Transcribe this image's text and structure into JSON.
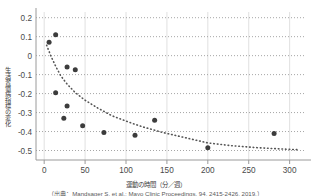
{
  "chart_data": {
    "type": "scatter",
    "title": "",
    "subtitle": "",
    "xlabel": "運動の時間（分／週）",
    "ylabel": "生活習慣病指標の変化",
    "xlim": [
      -10,
      320
    ],
    "ylim": [
      -0.55,
      0.23
    ],
    "xticks": [
      0,
      50,
      100,
      150,
      200,
      250,
      300
    ],
    "xticklabels": [
      "0",
      "50",
      "100",
      "150",
      "200",
      "250",
      "300"
    ],
    "yticks": [
      0.2,
      0.1,
      0,
      -0.1,
      -0.2,
      -0.3,
      -0.4,
      -0.5
    ],
    "yticklabels": [
      "0.2",
      "0.1",
      "0",
      "-0.1",
      "-0.2",
      "-0.3",
      "-0.4",
      "-0.5"
    ],
    "grid": "both-dotted-horizontal-solid-vertical",
    "legend": "none",
    "marker_color": "#3c3c3c",
    "trendline": {
      "style": "dotted",
      "color": "#555555",
      "description": "decreasing logarithmic fit"
    },
    "series": [
      {
        "name": "観測値",
        "points": [
          {
            "x": 6,
            "y": 0.07
          },
          {
            "x": 14,
            "y": 0.11
          },
          {
            "x": 14,
            "y": -0.195
          },
          {
            "x": 24,
            "y": -0.33
          },
          {
            "x": 28,
            "y": -0.06
          },
          {
            "x": 28,
            "y": -0.265
          },
          {
            "x": 38,
            "y": -0.075
          },
          {
            "x": 47,
            "y": -0.37
          },
          {
            "x": 73,
            "y": -0.405
          },
          {
            "x": 111,
            "y": -0.42
          },
          {
            "x": 135,
            "y": -0.34
          },
          {
            "x": 200,
            "y": -0.485
          },
          {
            "x": 281,
            "y": -0.41
          }
        ]
      }
    ],
    "trend_points": [
      {
        "x": 3,
        "y": 0.055
      },
      {
        "x": 8,
        "y": 0.0
      },
      {
        "x": 14,
        "y": -0.055
      },
      {
        "x": 20,
        "y": -0.105
      },
      {
        "x": 28,
        "y": -0.15
      },
      {
        "x": 38,
        "y": -0.195
      },
      {
        "x": 50,
        "y": -0.235
      },
      {
        "x": 65,
        "y": -0.275
      },
      {
        "x": 82,
        "y": -0.315
      },
      {
        "x": 100,
        "y": -0.345
      },
      {
        "x": 120,
        "y": -0.375
      },
      {
        "x": 145,
        "y": -0.405
      },
      {
        "x": 170,
        "y": -0.43
      },
      {
        "x": 200,
        "y": -0.46
      },
      {
        "x": 230,
        "y": -0.475
      },
      {
        "x": 260,
        "y": -0.485
      },
      {
        "x": 290,
        "y": -0.492
      },
      {
        "x": 312,
        "y": -0.496
      }
    ]
  },
  "axis": {
    "y_title": "生活習慣病指標の変化",
    "x_title": "運動の時間（分／週）"
  },
  "caption": {
    "text": "（出典：Mandsager S, et al.: Mayo Clinic Proceedings, 94, 2415-2426, 2019.）"
  }
}
